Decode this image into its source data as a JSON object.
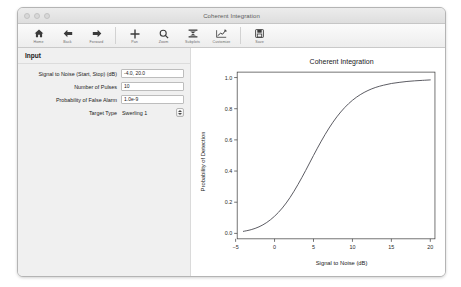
{
  "window": {
    "title": "Coherent Integration",
    "traffic_lights": [
      "close-button",
      "minimize-button",
      "zoom-button"
    ]
  },
  "toolbar": {
    "groups": [
      {
        "buttons": [
          {
            "icon": "home-icon",
            "label": "Home"
          },
          {
            "icon": "back-arrow-icon",
            "label": "Back"
          },
          {
            "icon": "forward-arrow-icon",
            "label": "Forward"
          }
        ]
      },
      {
        "buttons": [
          {
            "icon": "pan-icon",
            "label": "Pan"
          },
          {
            "icon": "zoom-icon",
            "label": "Zoom"
          },
          {
            "icon": "subplots-icon",
            "label": "Subplots"
          },
          {
            "icon": "customize-icon",
            "label": "Customize"
          }
        ]
      },
      {
        "buttons": [
          {
            "icon": "save-icon",
            "label": "Save"
          }
        ]
      }
    ]
  },
  "panel": {
    "header": "Input",
    "fields": [
      {
        "label": "Signal to Noise (Start, Stop) (dB)",
        "value": "-4.0, 20.0",
        "type": "text",
        "name": "signal-to-noise-field"
      },
      {
        "label": "Number of Pulses",
        "value": "10",
        "type": "text",
        "name": "number-of-pulses-field"
      },
      {
        "label": "Probability of False Alarm",
        "value": "1.0e-9",
        "type": "text",
        "name": "probability-of-false-alarm-field"
      },
      {
        "label": "Target Type",
        "value": "Swerling 1",
        "type": "combo",
        "name": "target-type-select"
      }
    ]
  },
  "chart_data": {
    "type": "line",
    "title": "Coherent Integration",
    "xlabel": "Signal to Noise (dB)",
    "ylabel": "Probability of Detection",
    "xlim": [
      -4.8,
      20.6
    ],
    "ylim": [
      -0.035,
      1.035
    ],
    "xticks": [
      -5,
      0,
      5,
      10,
      15,
      20
    ],
    "xticklabels": [
      "−5",
      "0",
      "5",
      "10",
      "15",
      "20"
    ],
    "yticks": [
      0.0,
      0.2,
      0.4,
      0.6,
      0.8,
      1.0
    ],
    "yticklabels": [
      "0.0",
      "0.2",
      "0.4",
      "0.6",
      "0.8",
      "1.0"
    ],
    "grid": false,
    "legend": null,
    "line_color": "#4a4a52",
    "series": [
      {
        "name": "Probability of Detection",
        "x": [
          -4.0,
          -3.0,
          -2.0,
          -1.0,
          0.0,
          1.0,
          2.0,
          3.0,
          4.0,
          5.0,
          6.0,
          7.0,
          8.0,
          9.0,
          10.0,
          11.0,
          12.0,
          13.0,
          14.0,
          15.0,
          16.0,
          17.0,
          18.0,
          19.0,
          20.0
        ],
        "y": [
          0.013,
          0.024,
          0.042,
          0.07,
          0.11,
          0.163,
          0.231,
          0.313,
          0.404,
          0.5,
          0.592,
          0.676,
          0.748,
          0.807,
          0.854,
          0.89,
          0.917,
          0.937,
          0.951,
          0.962,
          0.969,
          0.975,
          0.979,
          0.982,
          0.985
        ]
      }
    ]
  }
}
